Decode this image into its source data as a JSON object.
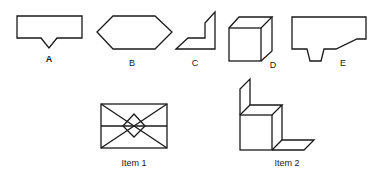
{
  "diagram": {
    "options": [
      {
        "id": "A",
        "label": "A",
        "shape": "rectangle-with-v-notch"
      },
      {
        "id": "B",
        "label": "B",
        "shape": "hexagon"
      },
      {
        "id": "C",
        "label": "C",
        "shape": "l-shaped-fold"
      },
      {
        "id": "D",
        "label": "D",
        "shape": "cube"
      },
      {
        "id": "E",
        "label": "E",
        "shape": "notched-polygon"
      }
    ],
    "items": [
      {
        "id": "item1",
        "label": "Item 1",
        "shape": "envelope-rectangle-with-diamond"
      },
      {
        "id": "item2",
        "label": "Item 2",
        "shape": "box-with-panel-and-floor"
      }
    ],
    "stroke_color": "#1a1a1a",
    "background": "#ffffff"
  }
}
